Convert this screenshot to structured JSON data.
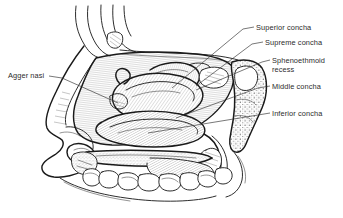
{
  "figure": {
    "style": "black-and-white engraved line drawing with hatched shading",
    "background_color": "#ffffff",
    "line_color": "#1a1a1a",
    "text_color": "#2b2b2b",
    "width": 343,
    "height": 218
  },
  "labels": [
    {
      "id": "agger-nasi",
      "text": "Agger nasi",
      "text_x": 8,
      "text_y": 78,
      "anchor": "start",
      "leader": "M 49 76 L 62 78 L 118 103",
      "side": "left"
    },
    {
      "id": "superior-concha",
      "text": "Superior concha",
      "text_x": 256,
      "text_y": 30,
      "anchor": "start",
      "leader": "M 254 27 L 243 29 L 172 88",
      "side": "right"
    },
    {
      "id": "supreme-concha",
      "text": "Supreme concha",
      "text_x": 265,
      "text_y": 45,
      "anchor": "start",
      "leader": "M 263 42 L 252 44 L 196 86",
      "side": "right"
    },
    {
      "id": "sphenoethmoid-recess",
      "text": "Sphenoethmoid",
      "text_x": 272,
      "text_y": 63,
      "anchor": "start",
      "leader": "M 270 60 L 262 62 L 196 90",
      "side": "right"
    },
    {
      "id": "sphenoethmoid-recess-line2",
      "text": "recess",
      "text_x": 272,
      "text_y": 72,
      "anchor": "start",
      "leader": "",
      "side": "right"
    },
    {
      "id": "middle-concha",
      "text": "Middle concha",
      "text_x": 272,
      "text_y": 89,
      "anchor": "start",
      "leader": "M 270 86 L 258 88 L 176 118",
      "side": "right"
    },
    {
      "id": "inferior-concha",
      "text": "Inferior concha",
      "text_x": 272,
      "text_y": 116,
      "anchor": "start",
      "leader": "M 270 113 L 258 115 L 148 133",
      "side": "right"
    }
  ],
  "anatomy": {
    "regions": [
      {
        "name": "frontal-forehead-contour",
        "note": "curved soft-tissue profile lines at upper left"
      },
      {
        "name": "external-nose-profile",
        "note": "nasal dorsum, tip, columella and nostril outline at left"
      },
      {
        "name": "nasal-cavity-lateral-wall",
        "note": "large hatched field forming the lateral wall"
      },
      {
        "name": "superior-concha",
        "note": "small scroll above the middle concha"
      },
      {
        "name": "supreme-concha",
        "note": "smallest uppermost scroll"
      },
      {
        "name": "sphenoethmoid-recess",
        "note": "recess behind the superior concha"
      },
      {
        "name": "middle-concha",
        "note": "large curved scroll in mid cavity"
      },
      {
        "name": "inferior-concha",
        "note": "lowest and longest curved scroll"
      },
      {
        "name": "sphenoid-pterygoid-bone",
        "note": "stippled cancellous bone block at right"
      },
      {
        "name": "hard-palate",
        "note": "horizontal plate beneath the nasal floor"
      },
      {
        "name": "soft-palate",
        "note": "hatched tapering flap posterior to hard palate"
      },
      {
        "name": "maxillary-teeth",
        "note": "row of crowns along lower alveolar arch"
      }
    ],
    "tooth_count": 8
  }
}
